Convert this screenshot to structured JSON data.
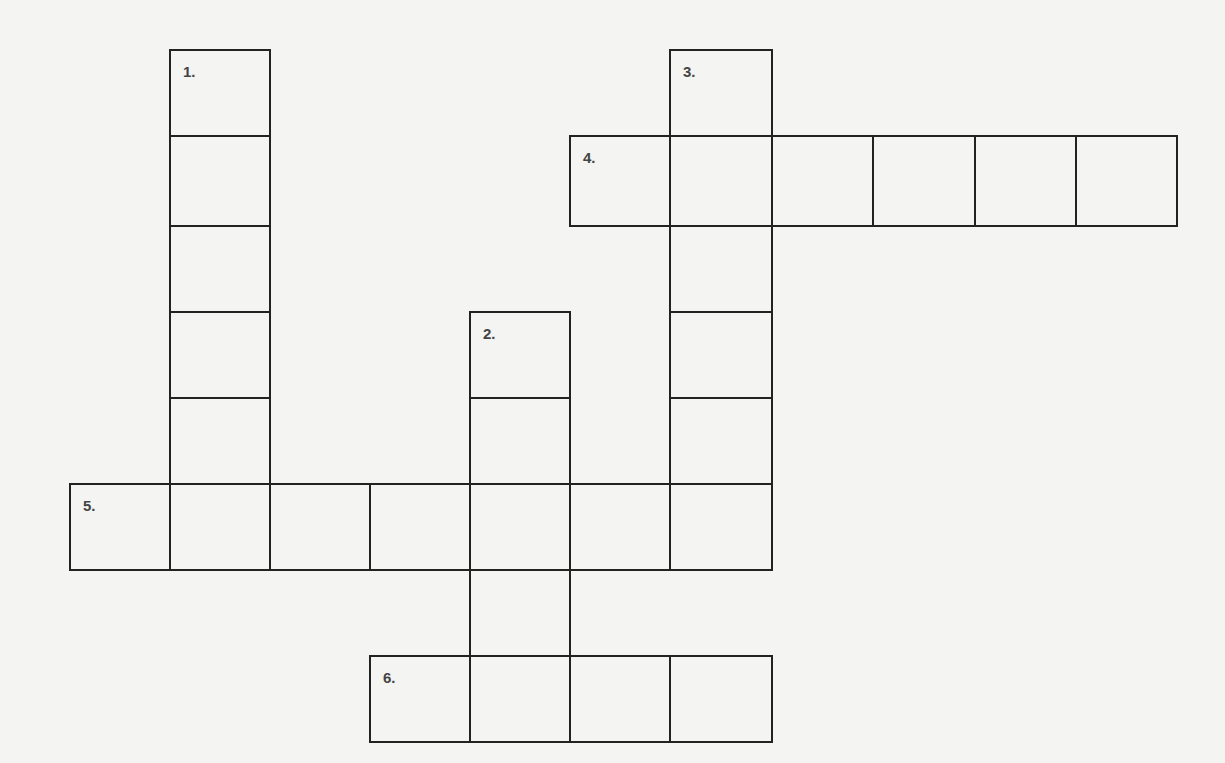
{
  "puzzle": {
    "type": "crossword",
    "layout": {
      "origin_x": 70,
      "origin_y": 50,
      "col_xs": [
        70,
        170,
        270,
        370,
        470,
        570,
        670,
        772,
        873,
        975,
        1076,
        1177
      ],
      "row_ys": [
        50,
        136,
        226,
        312,
        398,
        484,
        570,
        656,
        742
      ]
    },
    "entries": [
      {
        "number": "1.",
        "direction": "down",
        "row": 0,
        "col": 1,
        "length": 6
      },
      {
        "number": "2.",
        "direction": "down",
        "row": 3,
        "col": 4,
        "length": 5
      },
      {
        "number": "3.",
        "direction": "down",
        "row": 0,
        "col": 6,
        "length": 6
      },
      {
        "number": "4.",
        "direction": "across",
        "row": 1,
        "col": 5,
        "length": 6
      },
      {
        "number": "5.",
        "direction": "across",
        "row": 5,
        "col": 0,
        "length": 7
      },
      {
        "number": "6.",
        "direction": "across",
        "row": 7,
        "col": 3,
        "length": 4
      }
    ],
    "colors": {
      "background": "#f4f4f2",
      "grid_line": "#222222",
      "number_text": "#444444"
    }
  }
}
